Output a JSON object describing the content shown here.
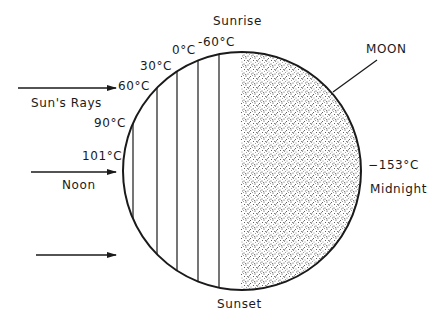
{
  "labels": {
    "sunrise": "Sunrise",
    "sunset": "Sunset",
    "noon": "Noon",
    "midnight": "Midnight",
    "moon": "MOON",
    "suns_rays": "Sun's Rays"
  },
  "temperatures": [
    {
      "position": "noon",
      "value": "101°C"
    },
    {
      "position": "band-1",
      "value": "90°C"
    },
    {
      "position": "band-2",
      "value": "60°C"
    },
    {
      "position": "band-3",
      "value": "30°C"
    },
    {
      "position": "band-4",
      "value": "0°C"
    },
    {
      "position": "terminator",
      "value": "-60°C"
    },
    {
      "position": "midnight",
      "value": "−153°C"
    }
  ],
  "colors": {
    "ink": "#1a1a1a",
    "background": "#ffffff",
    "stipple": "#2a2a2a"
  },
  "arrows": [
    {
      "name": "sun-ray-arrow-top",
      "x1": 18,
      "y1": 88,
      "x2": 116,
      "y2": 88
    },
    {
      "name": "sun-ray-arrow-noon",
      "x1": 31,
      "y1": 172,
      "x2": 116,
      "y2": 172
    },
    {
      "name": "sun-ray-arrow-bottom",
      "x1": 36,
      "y1": 255,
      "x2": 116,
      "y2": 255
    }
  ]
}
